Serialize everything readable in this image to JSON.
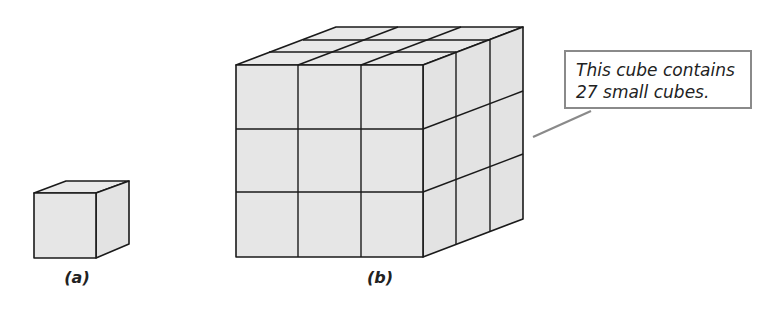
{
  "figure": {
    "panels": [
      {
        "id": "a",
        "label": "(a)",
        "description": "single small cube"
      },
      {
        "id": "b",
        "label": "(b)",
        "description": "3 x 3 x 3 cube made of small cubes",
        "grid": {
          "rows": 3,
          "cols": 3,
          "depth": 3
        }
      }
    ],
    "callout": {
      "lines": [
        "This cube contains",
        "27 small cubes."
      ],
      "target_panel": "b"
    },
    "colors": {
      "cube_fill": "#e6e6e6",
      "edge": "#1a1a1a",
      "callout_border": "#8a8a8a",
      "leader_line": "#8a8a8a"
    }
  }
}
